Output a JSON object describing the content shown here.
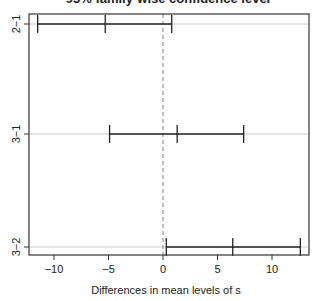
{
  "chart_data": {
    "type": "errorbar",
    "title": "95% family-wise confidence level",
    "title_visible": "cut off at top edge",
    "xlabel": "Differences in mean levels of s",
    "ylabel": "",
    "xlim": [
      -12.3,
      13.3
    ],
    "xticks": [
      -10,
      -5,
      0,
      5,
      10
    ],
    "xtick_labels": [
      "−10",
      "−5",
      "0",
      "5",
      "10"
    ],
    "reference_line": {
      "x": 0,
      "style": "dashed",
      "color": "#808080"
    },
    "grid": "horizontal lines at each comparison",
    "categories": [
      "2−1",
      "3−1",
      "3−2"
    ],
    "series": [
      {
        "name": "2-1",
        "lwr": -11.5,
        "diff": -5.3,
        "upr": 0.8
      },
      {
        "name": "3-1",
        "lwr": -4.9,
        "diff": 1.3,
        "upr": 7.4
      },
      {
        "name": "3-2",
        "lwr": 0.3,
        "diff": 6.4,
        "upr": 12.6
      }
    ]
  },
  "colors": {
    "axis": "#333333",
    "interval": "#222222",
    "grid": "#cccccc",
    "reference": "#808080"
  }
}
